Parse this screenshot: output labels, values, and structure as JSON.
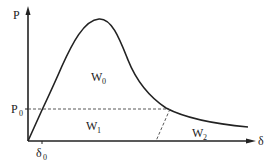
{
  "diagram": {
    "axes": {
      "y_label": "P",
      "x_label": "δ",
      "y_marker_label": "P",
      "y_marker_sub": "0",
      "x_marker_label": "δ",
      "x_marker_sub": "0"
    },
    "regions": [
      {
        "label": "W",
        "sub": "0"
      },
      {
        "label": "W",
        "sub": "1"
      },
      {
        "label": "W",
        "sub": "2"
      }
    ],
    "colors": {
      "line": "#222222",
      "dashed": "#444444",
      "background": "#ffffff"
    }
  }
}
